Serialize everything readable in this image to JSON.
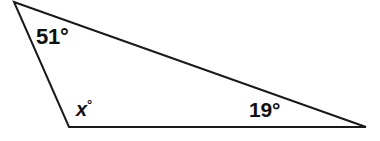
{
  "figure": {
    "name": "triangle-angle-diagram",
    "background_color": "#ffffff",
    "stroke_color": "#1a1a1a",
    "stroke_width": 2,
    "width": 380,
    "height": 141,
    "vertices": {
      "top_left": {
        "x": 14,
        "y": 2
      },
      "bottom_left": {
        "x": 69,
        "y": 127
      },
      "bottom_right": {
        "x": 366,
        "y": 127
      }
    },
    "labels": {
      "top_angle": "51°",
      "unknown_angle_value": "x",
      "unknown_angle_degree": "°",
      "right_angle": "19°"
    }
  },
  "chart_data": {
    "type": "diagram",
    "title": "",
    "shape": "triangle",
    "angles": [
      {
        "label": "51°",
        "value": 51,
        "vertex": "top_left",
        "known": true
      },
      {
        "label": "x°",
        "value": null,
        "vertex": "bottom_left",
        "known": false
      },
      {
        "label": "19°",
        "value": 19,
        "vertex": "bottom_right",
        "known": true
      }
    ]
  }
}
